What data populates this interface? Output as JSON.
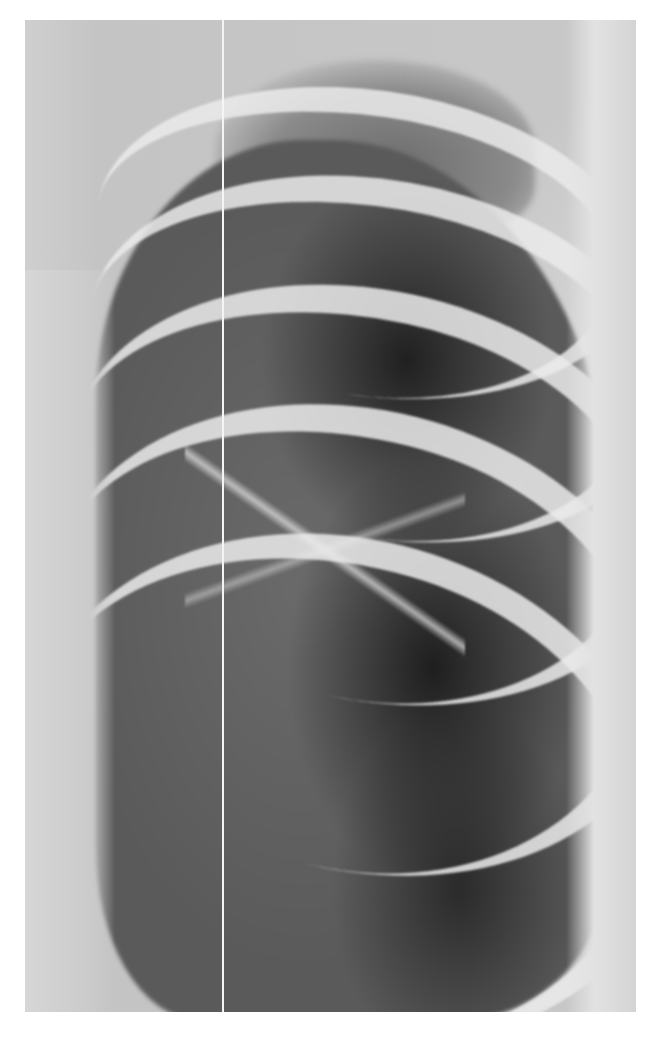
{
  "image": {
    "kind": "radiograph",
    "description": "Grayscale chest X-ray, oblique/lateral view of the left hemithorax showing curved ribs and lung markings",
    "colors": {
      "background": "#ffffff",
      "soft_tissue": "#c9c9c9",
      "lung_field": "#2a2a2a",
      "bone": "#e6e6e6"
    },
    "artifacts": [
      "vertical white line artifact"
    ]
  }
}
